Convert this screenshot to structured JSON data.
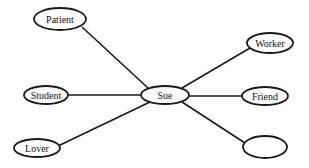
{
  "diagram": {
    "type": "star-network",
    "center": {
      "id": "sue",
      "label": "Sue",
      "cx": 165,
      "cy": 95,
      "rx": 24,
      "ry": 9
    },
    "nodes": [
      {
        "id": "patient",
        "label": "Patient",
        "cx": 60,
        "cy": 19,
        "rx": 26,
        "ry": 11
      },
      {
        "id": "worker",
        "label": "Worker",
        "cx": 270,
        "cy": 43,
        "rx": 23,
        "ry": 10
      },
      {
        "id": "student",
        "label": "Student",
        "cx": 46,
        "cy": 95,
        "rx": 22,
        "ry": 9
      },
      {
        "id": "friend",
        "label": "Friend",
        "cx": 265,
        "cy": 96,
        "rx": 23,
        "ry": 9
      },
      {
        "id": "lover",
        "label": "Lover",
        "cx": 37,
        "cy": 148,
        "rx": 23,
        "ry": 9
      },
      {
        "id": "empty",
        "label": "",
        "cx": 265,
        "cy": 147,
        "rx": 22,
        "ry": 11
      }
    ],
    "edges": [
      {
        "from": "sue",
        "to": "patient"
      },
      {
        "from": "sue",
        "to": "worker"
      },
      {
        "from": "sue",
        "to": "student"
      },
      {
        "from": "sue",
        "to": "friend"
      },
      {
        "from": "sue",
        "to": "lover"
      },
      {
        "from": "sue",
        "to": "empty"
      }
    ]
  },
  "labels": {
    "sue": "Sue",
    "patient": "Patient",
    "worker": "Worker",
    "student": "Student",
    "friend": "Friend",
    "lover": "Lover",
    "empty": ""
  }
}
